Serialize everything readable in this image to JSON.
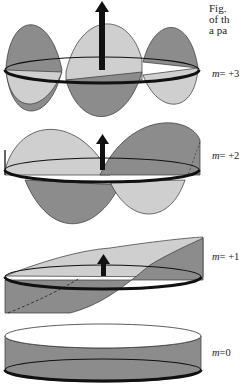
{
  "caption": {
    "lines": [
      "Fig.",
      "of th",
      "a pa"
    ]
  },
  "labels": [
    {
      "var": "m",
      "value": "= +3"
    },
    {
      "var": "m",
      "value": "= +2"
    },
    {
      "var": "m",
      "value": "= +1"
    },
    {
      "var": "m",
      "value": "=0"
    }
  ],
  "colors": {
    "dark_fill": "#8c8c8c",
    "light_fill": "#cfcfcf",
    "ring": "#111111",
    "arrow": "#111111"
  }
}
